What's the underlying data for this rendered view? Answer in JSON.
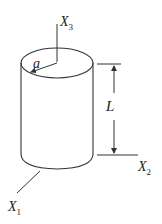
{
  "figure": {
    "colors": {
      "stroke": "#333333",
      "background": "#ffffff"
    },
    "labels": {
      "x3": {
        "main": "X",
        "sub": "3"
      },
      "x2": {
        "main": "X",
        "sub": "2"
      },
      "x1": {
        "main": "X",
        "sub": "1"
      },
      "radius": "a",
      "length": "L"
    }
  }
}
